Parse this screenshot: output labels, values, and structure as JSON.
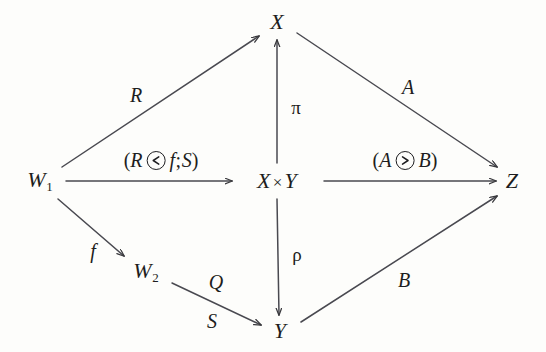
{
  "figure": {
    "background_color": "#fdfdfb",
    "ink_color": "#1d1d20"
  },
  "nodes": [
    {
      "id": "W1",
      "label": "W",
      "subscript": "1",
      "x": 40,
      "y": 181
    },
    {
      "id": "X",
      "label": "X",
      "subscript": "",
      "x": 277,
      "y": 22
    },
    {
      "id": "XY",
      "label": "X",
      "times": "×",
      "label2": "Y",
      "subscript": "",
      "x": 277,
      "y": 181
    },
    {
      "id": "Y",
      "label": "Y",
      "subscript": "",
      "x": 280,
      "y": 331
    },
    {
      "id": "W2",
      "label": "W",
      "subscript": "2",
      "x": 146,
      "y": 272
    },
    {
      "id": "Z",
      "label": "Z",
      "subscript": "",
      "x": 512,
      "y": 181
    }
  ],
  "edges": [
    {
      "id": "W1-X",
      "from": "W1",
      "to": "X",
      "label": "R"
    },
    {
      "id": "W1-XY",
      "from": "W1",
      "to": "XY",
      "label": "(R ⊘ f;S)"
    },
    {
      "id": "W1-W2",
      "from": "W1",
      "to": "W2",
      "label": "f"
    },
    {
      "id": "W2-Y",
      "from": "W2",
      "to": "Y",
      "label": "Q",
      "label_below": "S"
    },
    {
      "id": "XY-X",
      "from": "XY",
      "to": "X",
      "label": "π"
    },
    {
      "id": "XY-Y",
      "from": "XY",
      "to": "Y",
      "label": "ρ"
    },
    {
      "id": "XY-Z",
      "from": "XY",
      "to": "Z",
      "label": "(A ⊘ B)"
    },
    {
      "id": "X-Z",
      "from": "X",
      "to": "Z",
      "label": "A"
    },
    {
      "id": "Y-Z",
      "from": "Y",
      "to": "Z",
      "label": "B"
    }
  ],
  "labels": {
    "R": "R",
    "f": "f",
    "Q": "Q",
    "S": "S",
    "pi": "π",
    "rho": "ρ",
    "A": "A",
    "B": "B",
    "left_open_paren": "(",
    "left_first_term": "R",
    "left_second_term": "f",
    "left_semicolon": ";",
    "left_third_term": "S",
    "left_close_paren": ")",
    "left_operator_glyph": "circled-less-than",
    "right_open_paren": "(",
    "right_first_term": "A",
    "right_second_term": "B",
    "right_close_paren": ")",
    "right_operator_glyph": "circled-greater-than"
  }
}
